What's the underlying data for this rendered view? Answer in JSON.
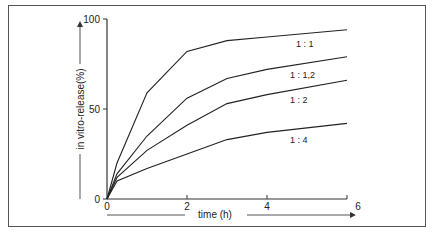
{
  "chart_data": {
    "type": "line",
    "title": "",
    "xlabel": "time (h)",
    "ylabel": "in vitro-release(%)",
    "xlim": [
      0,
      6
    ],
    "ylim": [
      0,
      100
    ],
    "x_ticks": [
      "0",
      "2",
      "4",
      "6"
    ],
    "y_ticks": [
      "0",
      "50",
      "100"
    ],
    "grid": false,
    "legend_position": "inline labels at right",
    "x": [
      0,
      0.25,
      1,
      2,
      3,
      4,
      6
    ],
    "series": [
      {
        "name": "1:1",
        "values": [
          0,
          20,
          59,
          82,
          88,
          90,
          94
        ]
      },
      {
        "name": "1:1,2",
        "values": [
          0,
          14,
          35,
          56,
          67,
          72,
          79
        ]
      },
      {
        "name": "1:2",
        "values": [
          0,
          12,
          27,
          41,
          53,
          58,
          66
        ]
      },
      {
        "name": "1:4",
        "values": [
          0,
          10,
          17,
          25,
          33,
          37,
          42
        ]
      }
    ]
  },
  "labels": {
    "xlabel": "time (h)",
    "ylabel": "in vitro-release(%)",
    "y0": "0",
    "y50": "50",
    "y100": "100",
    "x0": "0",
    "x2": "2",
    "x4": "4",
    "x6": "6",
    "s1": "1 : 1",
    "s2": "1 : 1,2",
    "s3": "1 : 2",
    "s4": "1 : 4"
  }
}
